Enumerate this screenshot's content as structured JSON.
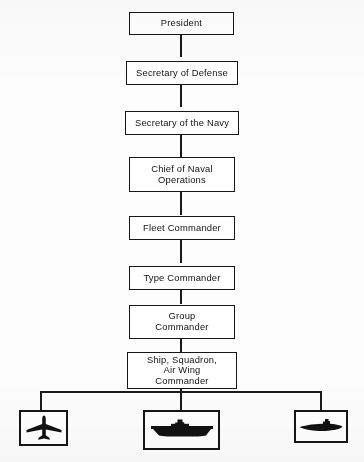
{
  "figure": {
    "type": "org-chart",
    "background_color": "#ffffff",
    "line_color": "#161616",
    "text_color": "#121212"
  },
  "chain": [
    {
      "id": "president",
      "label": "President"
    },
    {
      "id": "secdef",
      "label": "Secretary of Defense"
    },
    {
      "id": "secnav",
      "label": "Secretary of the Navy"
    },
    {
      "id": "cno",
      "label": "Chief of Naval\nOperations"
    },
    {
      "id": "fleet-commander",
      "label": "Fleet Commander"
    },
    {
      "id": "type-commander",
      "label": "Type Commander"
    },
    {
      "id": "group-commander",
      "label": "Group\nCommander"
    },
    {
      "id": "unit-commander",
      "label": "Ship, Squadron,\nAir Wing\nCommander"
    }
  ],
  "units": [
    {
      "id": "aircraft",
      "icon": "aircraft-icon",
      "label": "Aircraft"
    },
    {
      "id": "ship",
      "icon": "ship-icon",
      "label": "Ship"
    },
    {
      "id": "submarine",
      "icon": "submarine-icon",
      "label": "Submarine"
    }
  ]
}
